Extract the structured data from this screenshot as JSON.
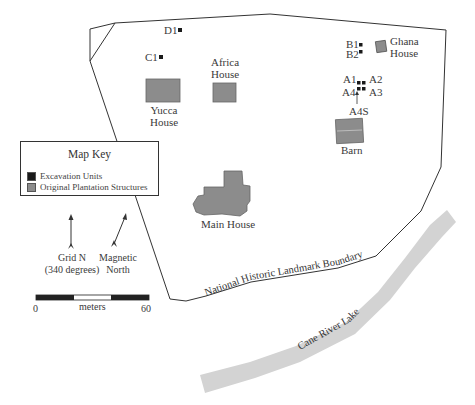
{
  "map": {
    "boundary_label": "National Historic Landmark Boundary",
    "river_label": "Cane River Lake",
    "colors": {
      "structure": "#8c8c8c",
      "excavation": "#1a1a1a",
      "river": "#d3d3d3",
      "boundary": "#333333"
    },
    "excavation_units": [
      {
        "label": "D1"
      },
      {
        "label": "C1"
      },
      {
        "label": "B1"
      },
      {
        "label": "B2"
      },
      {
        "label": "A1"
      },
      {
        "label": "A2"
      },
      {
        "label": "A3"
      },
      {
        "label": "A4"
      },
      {
        "label": "A4S"
      }
    ],
    "structures": {
      "yucca": [
        "Yucca",
        "House"
      ],
      "africa": [
        "Africa",
        "House"
      ],
      "ghana": [
        "Ghana",
        "House"
      ],
      "barn": "Barn",
      "main": "Main House"
    }
  },
  "key": {
    "title": "Map Key",
    "items": [
      {
        "label": "Excavation Units",
        "color": "#1a1a1a"
      },
      {
        "label": "Original Plantation Structures",
        "color": "#8c8c8c"
      }
    ]
  },
  "north": {
    "grid_label": [
      "Grid N",
      "(340 degrees)"
    ],
    "magnetic_label": [
      "Magnetic",
      "North"
    ]
  },
  "scale": {
    "unit": "meters",
    "start": "0",
    "end": "60"
  }
}
